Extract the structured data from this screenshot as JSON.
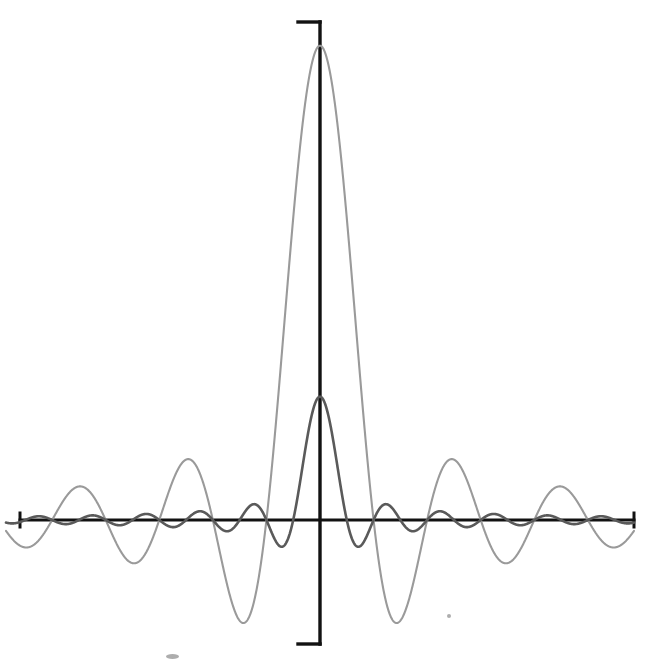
{
  "figure": {
    "title": "",
    "caption": "",
    "background_color": "#ffffff",
    "width_px": 651,
    "height_px": 665
  },
  "axes": {
    "color": "#121212",
    "origin_x_px": 320,
    "origin_y_px": 520,
    "x_axis": {
      "name": "horizontal-axis",
      "left_px": 20,
      "right_px": 634,
      "tick_left_label": "",
      "tick_right_label": "",
      "end_tick_length_px": 14,
      "label": ""
    },
    "y_axis": {
      "name": "vertical-axis",
      "top_px": 22,
      "bottom_px": 644,
      "tick_top_label": "",
      "tick_bottom_label": "",
      "end_tick_length_px": 22,
      "label": ""
    },
    "tick_labels": [],
    "grid": false
  },
  "legend": {
    "visible": false,
    "position": "none",
    "entries": []
  },
  "annotations": [],
  "chart_data": {
    "type": "line",
    "title": "",
    "subtitle": "",
    "xlabel": "",
    "ylabel": "",
    "xlim": [
      -16,
      16
    ],
    "ylim": [
      -0.28,
      1.05
    ],
    "grid": false,
    "legend_position": "none",
    "series": [
      {
        "name": "narrow-tall-curve",
        "color": "#9a9a9a",
        "line_width_px": 2.1,
        "peak_value": 1.0,
        "peak_x": 0,
        "first_zero_x": 1.15,
        "lobe_period_x": 2.3,
        "envelope_decay": "1/x",
        "form": "sinc",
        "sinc_scale": 2.73,
        "description": "Tall narrow central peak reaching the top of the frame with high-frequency, slowly decaying side lobes.",
        "x": [
          -16,
          -15,
          -14,
          -13,
          -12,
          -11,
          -10,
          -9,
          -8,
          -7,
          -6,
          -5,
          -4,
          -3,
          -2,
          -1,
          0,
          1,
          2,
          3,
          4,
          5,
          6,
          7,
          8,
          9,
          10,
          11,
          12,
          13,
          14,
          15,
          16
        ],
        "values": [
          0.02,
          -0.03,
          0.03,
          -0.04,
          0.04,
          -0.05,
          0.05,
          -0.06,
          0.07,
          -0.09,
          0.11,
          -0.13,
          0.17,
          -0.23,
          0.35,
          -0.69,
          1.0,
          -0.69,
          0.35,
          -0.23,
          0.17,
          -0.13,
          0.11,
          -0.09,
          0.07,
          -0.06,
          0.05,
          -0.05,
          0.04,
          -0.04,
          0.03,
          -0.03,
          0.02
        ]
      },
      {
        "name": "broad-short-curve",
        "color": "#5a5a5a",
        "line_width_px": 2.6,
        "peak_value": 0.26,
        "peak_x": 0,
        "first_zero_x": 2.3,
        "lobe_period_x": 4.6,
        "envelope_decay": "1/x",
        "form": "sinc",
        "sinc_scale": 1.365,
        "description": "Broader, much lower central lobe with roughly half the oscillation frequency of the narrow curve.",
        "x": [
          -16,
          -15,
          -14,
          -13,
          -12,
          -11,
          -10,
          -9,
          -8,
          -7,
          -6,
          -5,
          -4,
          -3,
          -2,
          -1,
          0,
          1,
          2,
          3,
          4,
          5,
          6,
          7,
          8,
          9,
          10,
          11,
          12,
          13,
          14,
          15,
          16
        ],
        "values": [
          0.008,
          0.012,
          0.0,
          -0.015,
          -0.018,
          -0.005,
          0.018,
          0.025,
          0.008,
          -0.025,
          -0.038,
          -0.015,
          0.04,
          0.062,
          0.025,
          -0.075,
          -0.135,
          -0.07,
          0.025,
          0.062,
          0.04,
          -0.015,
          -0.038,
          -0.025,
          0.008,
          0.025,
          0.018,
          -0.005,
          -0.018,
          -0.015,
          0.0,
          0.012,
          0.008
        ]
      }
    ]
  },
  "scan_artifacts": [
    {
      "name": "speck-lower-left",
      "x_px": 166,
      "y_px": 654,
      "w_px": 13,
      "h_px": 5
    },
    {
      "name": "speck-lower-right",
      "x_px": 447,
      "y_px": 614,
      "w_px": 4,
      "h_px": 4
    }
  ]
}
